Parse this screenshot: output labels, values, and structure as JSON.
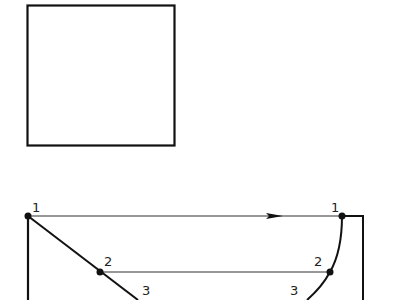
{
  "diagram": {
    "colors": {
      "stroke": "#111111",
      "thin_stroke": "#333333",
      "background": "#ffffff"
    },
    "square": {
      "x": 27,
      "y": 5,
      "width": 148,
      "height": 141
    },
    "left_points": [
      {
        "label": "1",
        "x": 28,
        "y": 216
      },
      {
        "label": "2",
        "x": 100,
        "y": 272
      },
      {
        "label": "3",
        "x": 136,
        "y": 298
      }
    ],
    "right_points": [
      {
        "label": "1",
        "x": 342,
        "y": 216
      },
      {
        "label": "2",
        "x": 330,
        "y": 272
      },
      {
        "label": "3",
        "x": 308,
        "y": 300
      }
    ],
    "labels": {
      "left_1": "1",
      "left_2": "2",
      "left_3": "3",
      "right_1": "1",
      "right_2": "2",
      "right_3": "3"
    },
    "arrow": {
      "direction": "right",
      "tip_x": 283,
      "y": 216
    }
  }
}
